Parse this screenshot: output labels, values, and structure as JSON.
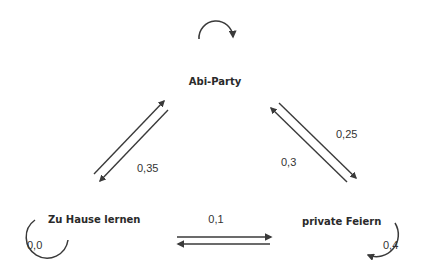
{
  "diagram": {
    "type": "state-transition",
    "colors": {
      "stroke": "#3a3a3a",
      "text": "#2a2a2a",
      "background": "#ffffff"
    },
    "nodes": [
      {
        "id": "abi",
        "label": "Abi-Party"
      },
      {
        "id": "home",
        "label": "Zu Hause lernen"
      },
      {
        "id": "private",
        "label": "private Feiern"
      }
    ],
    "edges": [
      {
        "from": "home",
        "to": "abi",
        "label": "0,35"
      },
      {
        "from": "abi",
        "to": "home",
        "label": ""
      },
      {
        "from": "abi",
        "to": "private",
        "label": "0,25"
      },
      {
        "from": "private",
        "to": "abi",
        "label": "0,3"
      },
      {
        "from": "home",
        "to": "private",
        "label": "0,1"
      },
      {
        "from": "private",
        "to": "home",
        "label": ""
      },
      {
        "from": "abi",
        "to": "abi",
        "label": ""
      },
      {
        "from": "home",
        "to": "home",
        "label": "0,0"
      },
      {
        "from": "private",
        "to": "private",
        "label": "0,4"
      }
    ]
  }
}
